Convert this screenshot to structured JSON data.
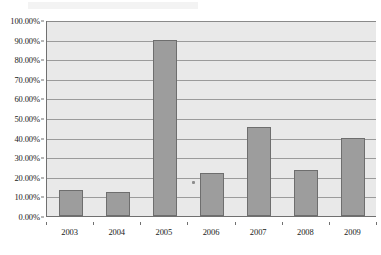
{
  "chart_data": {
    "type": "bar",
    "title": "",
    "subtitle": "",
    "xlabel": "",
    "ylabel": "",
    "categories": [
      "2003",
      "2004",
      "2005",
      "2006",
      "2007",
      "2008",
      "2009"
    ],
    "values": [
      13.5,
      12.0,
      89.9,
      22.0,
      45.5,
      23.5,
      40.0
    ],
    "value_format": "percent",
    "ylim": [
      0,
      100
    ],
    "ytick_values": [
      0,
      10,
      20,
      30,
      40,
      50,
      60,
      70,
      80,
      90,
      100
    ],
    "ytick_labels": [
      "0.00%",
      "10.00%",
      "20.00%",
      "30.00%",
      "40.00%",
      "50.00%",
      "60.00%",
      "70.00%",
      "80.00%",
      "90.00%",
      "100.00%"
    ],
    "grid": true,
    "grid_axis": "y",
    "legend": false,
    "legend_position": "none",
    "series": [
      {
        "name": "",
        "values": [
          13.5,
          12.0,
          89.9,
          22.0,
          45.5,
          23.5,
          40.0
        ]
      }
    ],
    "colors": {
      "bar_fill": "#9d9d9d",
      "bar_border": "#6e6e6e",
      "plot_background": "#e9e9e9",
      "gridline": "#9b9b9b",
      "axis_line": "#707070",
      "text": "#1a1a1a",
      "page_background": "#ffffff"
    }
  }
}
